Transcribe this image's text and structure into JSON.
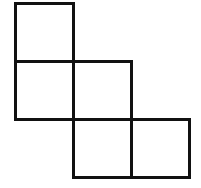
{
  "diagram": {
    "title": "",
    "stroke_color": "#111111",
    "background_color": "#ffffff",
    "stroke_width": 3,
    "cell_size": 61,
    "origin": {
      "x": 14,
      "y": 2
    },
    "cells": [
      {
        "id": "square-1",
        "row": 0,
        "col": 0
      },
      {
        "id": "square-2",
        "row": 1,
        "col": 0
      },
      {
        "id": "square-3",
        "row": 1,
        "col": 1
      },
      {
        "id": "square-4",
        "row": 2,
        "col": 1
      },
      {
        "id": "square-5",
        "row": 2,
        "col": 2
      }
    ]
  }
}
